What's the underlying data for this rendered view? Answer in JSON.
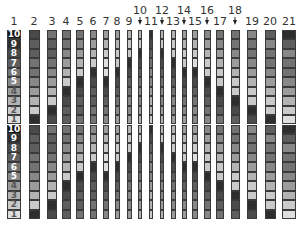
{
  "diagram": {
    "strip_top": 30,
    "strip_bottom": 219,
    "cells_per_strip": 20,
    "reference_labels": [
      "10",
      "9",
      "8",
      "7",
      "6",
      "5",
      "4",
      "3",
      "2",
      "1",
      "10",
      "9",
      "8",
      "7",
      "6",
      "5",
      "4",
      "3",
      "2",
      "1"
    ],
    "columns": [
      {
        "label": "1",
        "x": 14,
        "w": 14,
        "label_row": "low",
        "arrow": false,
        "levels": [
          0,
          1,
          2,
          3,
          4,
          5,
          6,
          7,
          8,
          9,
          0,
          1,
          2,
          3,
          4,
          5,
          6,
          7,
          8,
          9
        ]
      },
      {
        "label": "2",
        "x": 34,
        "w": 11,
        "label_row": "low",
        "arrow": false,
        "levels": [
          2,
          3,
          3,
          4,
          4,
          5,
          6,
          7,
          8,
          1,
          2,
          3,
          3,
          4,
          4,
          5,
          6,
          7,
          8,
          1
        ]
      },
      {
        "label": "3",
        "x": 52,
        "w": 10,
        "label_row": "low",
        "arrow": false,
        "levels": [
          4,
          3,
          3,
          4,
          5,
          6,
          7,
          8,
          1,
          2,
          4,
          3,
          3,
          4,
          5,
          6,
          7,
          8,
          1,
          2
        ]
      },
      {
        "label": "4",
        "x": 66,
        "w": 9,
        "label_row": "low",
        "arrow": false,
        "levels": [
          4,
          4,
          5,
          6,
          7,
          8,
          1,
          2,
          3,
          3,
          4,
          4,
          5,
          6,
          7,
          8,
          1,
          2,
          3,
          3
        ]
      },
      {
        "label": "5",
        "x": 80,
        "w": 8,
        "label_row": "low",
        "arrow": false,
        "levels": [
          4,
          5,
          6,
          7,
          8,
          1,
          2,
          3,
          3,
          4,
          4,
          5,
          6,
          7,
          8,
          1,
          2,
          3,
          3,
          4
        ]
      },
      {
        "label": "6",
        "x": 93,
        "w": 7,
        "label_row": "low",
        "arrow": false,
        "levels": [
          5,
          6,
          7,
          8,
          1,
          2,
          3,
          3,
          4,
          4,
          5,
          6,
          7,
          8,
          1,
          2,
          3,
          3,
          4,
          4
        ]
      },
      {
        "label": "7",
        "x": 106,
        "w": 6,
        "label_row": "low",
        "arrow": false,
        "levels": [
          6,
          7,
          8,
          9,
          9,
          1,
          2,
          3,
          4,
          5,
          6,
          7,
          8,
          9,
          9,
          1,
          2,
          3,
          4,
          5
        ]
      },
      {
        "label": "8",
        "x": 117,
        "w": 5,
        "label_row": "low",
        "arrow": false,
        "levels": [
          6,
          7,
          8,
          8,
          1,
          2,
          3,
          4,
          5,
          6,
          6,
          7,
          8,
          8,
          1,
          2,
          3,
          4,
          5,
          6
        ]
      },
      {
        "label": "9",
        "x": 129,
        "w": 5,
        "label_row": "low",
        "arrow": false,
        "levels": [
          7,
          8,
          8,
          1,
          2,
          3,
          4,
          5,
          5,
          6,
          7,
          8,
          8,
          1,
          2,
          3,
          4,
          5,
          5,
          6
        ]
      },
      {
        "label": "10",
        "x": 140,
        "w": 4,
        "label_row": "high",
        "arrow": true,
        "levels": [
          7,
          8,
          1,
          2,
          3,
          4,
          5,
          5,
          6,
          7,
          7,
          8,
          1,
          2,
          3,
          4,
          5,
          5,
          6,
          7
        ]
      },
      {
        "label": "11",
        "x": 151,
        "w": 4,
        "label_row": "low",
        "arrow": false,
        "levels": [
          1,
          2,
          3,
          4,
          5,
          5,
          6,
          7,
          7,
          8,
          1,
          2,
          3,
          4,
          5,
          5,
          6,
          7,
          7,
          8
        ]
      },
      {
        "label": "12",
        "x": 162,
        "w": 4,
        "label_row": "high",
        "arrow": true,
        "levels": [
          7,
          8,
          1,
          2,
          3,
          4,
          5,
          5,
          6,
          7,
          7,
          8,
          1,
          2,
          3,
          4,
          5,
          5,
          6,
          7
        ]
      },
      {
        "label": "13",
        "x": 173,
        "w": 5,
        "label_row": "low",
        "arrow": false,
        "levels": [
          7,
          8,
          8,
          1,
          2,
          3,
          4,
          5,
          5,
          6,
          7,
          8,
          8,
          1,
          2,
          3,
          4,
          5,
          5,
          6
        ]
      },
      {
        "label": "14",
        "x": 184,
        "w": 5,
        "label_row": "high",
        "arrow": true,
        "levels": [
          6,
          7,
          8,
          8,
          1,
          2,
          3,
          4,
          5,
          6,
          6,
          7,
          8,
          8,
          1,
          2,
          3,
          4,
          5,
          6
        ]
      },
      {
        "label": "15",
        "x": 195,
        "w": 6,
        "label_row": "low",
        "arrow": false,
        "levels": [
          6,
          7,
          8,
          9,
          1,
          2,
          3,
          4,
          5,
          5,
          6,
          7,
          8,
          9,
          1,
          2,
          3,
          4,
          5,
          5
        ]
      },
      {
        "label": "16",
        "x": 207,
        "w": 7,
        "label_row": "high",
        "arrow": true,
        "levels": [
          5,
          6,
          7,
          8,
          8,
          1,
          2,
          3,
          4,
          5,
          5,
          6,
          7,
          8,
          8,
          1,
          2,
          3,
          4,
          5
        ]
      },
      {
        "label": "17",
        "x": 220,
        "w": 8,
        "label_row": "low",
        "arrow": false,
        "levels": [
          4,
          5,
          6,
          7,
          8,
          8,
          1,
          2,
          3,
          4,
          4,
          5,
          6,
          7,
          8,
          8,
          1,
          2,
          3,
          4
        ]
      },
      {
        "label": "18",
        "x": 235,
        "w": 9,
        "label_row": "high",
        "arrow": true,
        "levels": [
          4,
          4,
          5,
          6,
          7,
          8,
          8,
          1,
          2,
          3,
          4,
          4,
          5,
          6,
          7,
          8,
          8,
          1,
          2,
          3
        ]
      },
      {
        "label": "19",
        "x": 252,
        "w": 10,
        "label_row": "low",
        "arrow": false,
        "levels": [
          5,
          4,
          4,
          5,
          6,
          7,
          8,
          8,
          1,
          2,
          5,
          4,
          4,
          5,
          6,
          7,
          8,
          8,
          1,
          2
        ]
      },
      {
        "label": "20",
        "x": 270,
        "w": 11,
        "label_row": "low",
        "arrow": false,
        "levels": [
          3,
          5,
          4,
          4,
          5,
          6,
          7,
          8,
          8,
          1,
          3,
          5,
          4,
          4,
          5,
          6,
          7,
          8,
          8,
          1
        ]
      },
      {
        "label": "21",
        "x": 289,
        "w": 14,
        "label_row": "low",
        "arrow": false,
        "levels": [
          1,
          3,
          5,
          4,
          4,
          5,
          6,
          7,
          8,
          9,
          1,
          3,
          5,
          4,
          4,
          5,
          6,
          7,
          8,
          9
        ]
      }
    ],
    "gray_scale": [
      "#141414",
      "#2e2e2e",
      "#4a4a4a",
      "#5e5e5e",
      "#737373",
      "#888888",
      "#9c9c9c",
      "#b3b3b3",
      "#cacaca",
      "#dedede"
    ],
    "label_rows": {
      "low": 16,
      "high": 5
    },
    "arrow_top": 17
  }
}
